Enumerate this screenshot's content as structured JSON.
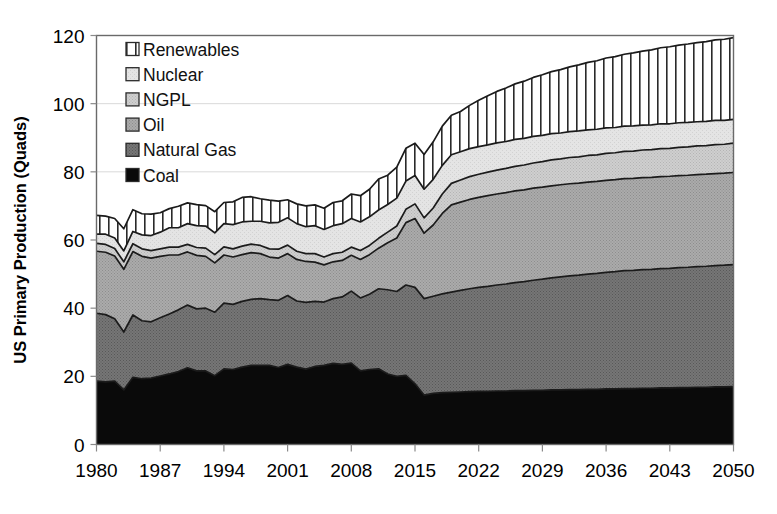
{
  "chart_data": {
    "type": "area",
    "title": "",
    "subtitle": "",
    "xlabel": "",
    "ylabel": "US Primary Production (Quads)",
    "xlim": [
      1980,
      2050
    ],
    "ylim": [
      0,
      120
    ],
    "ytick_step": 20,
    "xtick_step": 7,
    "grid": true,
    "stacked": true,
    "legend_position": "inside-top-left",
    "xticks": [
      "1980",
      "1987",
      "1994",
      "2001",
      "2008",
      "2015",
      "2022",
      "2029",
      "2036",
      "2043",
      "2050"
    ],
    "yticks": [
      "0",
      "20",
      "40",
      "60",
      "80",
      "100",
      "120"
    ],
    "x": [
      1980,
      1981,
      1982,
      1983,
      1984,
      1985,
      1986,
      1987,
      1988,
      1989,
      1990,
      1991,
      1992,
      1993,
      1994,
      1995,
      1996,
      1997,
      1998,
      1999,
      2000,
      2001,
      2002,
      2003,
      2004,
      2005,
      2006,
      2007,
      2008,
      2009,
      2010,
      2011,
      2012,
      2013,
      2014,
      2015,
      2016,
      2017,
      2018,
      2019,
      2020,
      2021,
      2022,
      2023,
      2024,
      2025,
      2026,
      2027,
      2028,
      2029,
      2030,
      2031,
      2032,
      2033,
      2034,
      2035,
      2036,
      2037,
      2038,
      2039,
      2040,
      2041,
      2042,
      2043,
      2044,
      2045,
      2046,
      2047,
      2048,
      2049,
      2050
    ],
    "series": [
      {
        "name": "Coal",
        "color": "#0a0a0a",
        "pattern": "solid",
        "values": [
          18.6,
          18.4,
          18.6,
          16.0,
          19.7,
          19.3,
          19.5,
          20.1,
          20.7,
          21.4,
          22.5,
          21.6,
          21.6,
          20.2,
          22.2,
          22.0,
          22.7,
          23.2,
          23.2,
          23.2,
          22.6,
          23.5,
          22.7,
          22.1,
          22.9,
          23.2,
          23.8,
          23.5,
          23.9,
          21.6,
          22.0,
          22.2,
          20.7,
          20.0,
          20.3,
          17.8,
          14.5,
          15.0,
          15.2,
          15.3,
          15.4,
          15.5,
          15.6,
          15.6,
          15.7,
          15.7,
          15.8,
          15.8,
          15.9,
          15.9,
          16.0,
          16.0,
          16.1,
          16.1,
          16.2,
          16.2,
          16.3,
          16.3,
          16.4,
          16.4,
          16.5,
          16.5,
          16.6,
          16.6,
          16.7,
          16.7,
          16.8,
          16.8,
          16.9,
          16.9,
          17.0
        ]
      },
      {
        "name": "Natural Gas",
        "color": "#6e6e6e",
        "pattern": "dither-dark",
        "values": [
          19.9,
          19.7,
          18.3,
          17.0,
          18.3,
          17.0,
          16.5,
          17.1,
          17.6,
          18.1,
          18.4,
          18.2,
          18.4,
          18.6,
          19.3,
          19.1,
          19.3,
          19.4,
          19.6,
          19.3,
          19.7,
          20.2,
          19.4,
          19.6,
          19.1,
          18.6,
          19.0,
          19.8,
          21.1,
          21.4,
          22.1,
          23.5,
          24.7,
          24.9,
          26.5,
          28.3,
          28.3,
          28.5,
          29.0,
          29.4,
          29.8,
          30.2,
          30.5,
          30.8,
          31.1,
          31.4,
          31.7,
          32.0,
          32.3,
          32.6,
          32.9,
          33.2,
          33.4,
          33.6,
          33.8,
          34.0,
          34.2,
          34.4,
          34.6,
          34.7,
          34.8,
          34.9,
          35.0,
          35.1,
          35.2,
          35.3,
          35.4,
          35.5,
          35.6,
          35.7,
          35.8
        ]
      },
      {
        "name": "Oil",
        "color": "#a3a3a3",
        "pattern": "dither-mid",
        "values": [
          18.2,
          18.3,
          18.4,
          18.4,
          18.6,
          18.9,
          18.7,
          18.0,
          17.3,
          16.1,
          15.6,
          15.7,
          15.2,
          14.5,
          14.1,
          13.9,
          13.7,
          13.7,
          13.2,
          12.5,
          12.4,
          12.3,
          12.2,
          12.0,
          11.5,
          10.9,
          10.8,
          10.7,
          10.5,
          11.3,
          11.6,
          11.9,
          13.8,
          15.7,
          18.3,
          20.2,
          19.2,
          20.9,
          23.6,
          25.6,
          25.9,
          26.2,
          26.4,
          26.6,
          26.7,
          26.8,
          26.9,
          26.9,
          27.0,
          27.0,
          27.0,
          27.0,
          27.0,
          27.0,
          27.0,
          27.0,
          27.0,
          27.0,
          27.0,
          27.0,
          27.0,
          27.0,
          27.0,
          27.0,
          27.0,
          27.0,
          27.0,
          27.0,
          27.0,
          27.0,
          27.0
        ]
      },
      {
        "name": "NGPL",
        "color": "#c6c6c6",
        "pattern": "dither-light",
        "values": [
          2.3,
          2.3,
          2.2,
          2.2,
          2.3,
          2.2,
          2.2,
          2.2,
          2.3,
          2.3,
          2.2,
          2.3,
          2.4,
          2.4,
          2.4,
          2.4,
          2.5,
          2.5,
          2.4,
          2.4,
          2.6,
          2.5,
          2.4,
          2.3,
          2.5,
          2.3,
          2.4,
          2.4,
          2.4,
          2.6,
          2.7,
          2.9,
          3.1,
          3.5,
          3.9,
          4.3,
          4.5,
          5.0,
          5.7,
          6.3,
          6.5,
          6.7,
          6.8,
          6.9,
          7.0,
          7.1,
          7.2,
          7.3,
          7.4,
          7.5,
          7.6,
          7.6,
          7.7,
          7.7,
          7.8,
          7.8,
          7.9,
          7.9,
          8.0,
          8.0,
          8.1,
          8.1,
          8.2,
          8.2,
          8.3,
          8.3,
          8.4,
          8.4,
          8.5,
          8.5,
          8.6
        ]
      },
      {
        "name": "Nuclear",
        "color": "#e2e2e2",
        "pattern": "near-white",
        "values": [
          2.7,
          3.0,
          3.1,
          3.2,
          3.6,
          4.1,
          4.4,
          4.9,
          5.7,
          5.7,
          6.1,
          6.4,
          6.5,
          6.4,
          6.8,
          7.1,
          7.1,
          6.7,
          7.1,
          7.6,
          7.9,
          8.0,
          8.1,
          7.9,
          8.2,
          8.1,
          8.2,
          8.4,
          8.4,
          8.4,
          8.4,
          8.3,
          8.1,
          8.2,
          8.3,
          8.3,
          8.4,
          8.4,
          8.4,
          8.4,
          8.3,
          8.2,
          8.1,
          8.0,
          8.0,
          7.9,
          7.9,
          7.8,
          7.8,
          7.7,
          7.7,
          7.6,
          7.6,
          7.6,
          7.5,
          7.5,
          7.5,
          7.4,
          7.4,
          7.4,
          7.3,
          7.3,
          7.3,
          7.2,
          7.2,
          7.2,
          7.1,
          7.1,
          7.1,
          7.0,
          7.0
        ]
      },
      {
        "name": "Renewables",
        "color": "#ffffff",
        "pattern": "vertical-stripes",
        "values": [
          5.5,
          5.3,
          5.7,
          6.5,
          6.4,
          6.2,
          6.3,
          5.7,
          5.6,
          6.3,
          6.1,
          6.2,
          6.0,
          6.2,
          6.2,
          6.7,
          7.2,
          7.2,
          6.6,
          6.7,
          6.2,
          5.3,
          5.8,
          6.1,
          6.1,
          6.2,
          6.8,
          6.7,
          7.2,
          7.7,
          8.1,
          9.1,
          8.6,
          9.1,
          9.6,
          9.5,
          10.2,
          11.0,
          11.5,
          11.6,
          11.8,
          12.7,
          13.6,
          14.4,
          15.1,
          15.7,
          16.3,
          16.8,
          17.3,
          17.8,
          18.2,
          18.6,
          19.0,
          19.4,
          19.8,
          20.1,
          20.5,
          20.8,
          21.1,
          21.4,
          21.7,
          22.0,
          22.3,
          22.6,
          22.8,
          23.0,
          23.2,
          23.4,
          23.6,
          23.8,
          24.0
        ]
      }
    ],
    "legend": [
      {
        "label": "Renewables",
        "swatch": "vertical-stripes",
        "color": "#ffffff"
      },
      {
        "label": "Nuclear",
        "swatch": "near-white",
        "color": "#e2e2e2"
      },
      {
        "label": "NGPL",
        "swatch": "dither-light",
        "color": "#c6c6c6"
      },
      {
        "label": "Oil",
        "swatch": "dither-mid",
        "color": "#a3a3a3"
      },
      {
        "label": "Natural Gas",
        "swatch": "dither-dark",
        "color": "#6e6e6e"
      },
      {
        "label": "Coal",
        "swatch": "solid",
        "color": "#0a0a0a"
      }
    ]
  }
}
